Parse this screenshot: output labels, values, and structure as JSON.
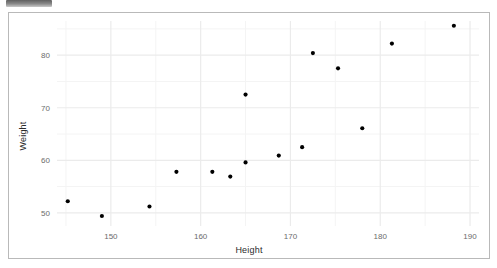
{
  "window": {
    "top_chip_label": ""
  },
  "chart_data": {
    "type": "scatter",
    "title": "",
    "xlabel": "Height",
    "ylabel": "Weight",
    "xlim": [
      144,
      191
    ],
    "ylim": [
      47.5,
      86.5
    ],
    "xticks": [
      150,
      160,
      170,
      180,
      190
    ],
    "yticks": [
      50,
      60,
      70,
      80
    ],
    "x_minor_ticks": [
      145,
      155,
      165,
      175,
      185
    ],
    "y_minor_ticks": [
      55,
      65,
      75,
      85
    ],
    "grid": true,
    "legend": "none",
    "point_color": "#000000",
    "point_size": 3,
    "panel_background": "#ffffff",
    "grid_color": "#ebebeb",
    "series": [
      {
        "name": "observations",
        "points": [
          {
            "x": 145.2,
            "y": 52.2
          },
          {
            "x": 149.0,
            "y": 49.4
          },
          {
            "x": 154.3,
            "y": 51.2
          },
          {
            "x": 157.3,
            "y": 57.8
          },
          {
            "x": 161.3,
            "y": 57.8
          },
          {
            "x": 163.3,
            "y": 56.9
          },
          {
            "x": 165.0,
            "y": 59.6
          },
          {
            "x": 165.0,
            "y": 72.5
          },
          {
            "x": 168.7,
            "y": 60.9
          },
          {
            "x": 171.3,
            "y": 62.5
          },
          {
            "x": 172.5,
            "y": 80.4
          },
          {
            "x": 175.3,
            "y": 77.5
          },
          {
            "x": 178.0,
            "y": 66.1
          },
          {
            "x": 181.3,
            "y": 82.2
          },
          {
            "x": 188.2,
            "y": 85.6
          }
        ]
      }
    ]
  },
  "axes": {
    "x_tick_labels": [
      "150",
      "160",
      "170",
      "180",
      "190"
    ],
    "y_tick_labels": [
      "80",
      "70",
      "60",
      "50"
    ]
  }
}
